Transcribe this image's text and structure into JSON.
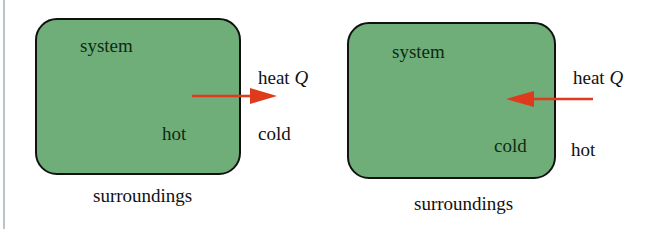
{
  "colors": {
    "system_fill": "#6fae78",
    "border": "#111111",
    "arrow": "#e03a1c",
    "rule": "#b9c3c8"
  },
  "panels": [
    {
      "system_label": "system",
      "system_temp": "hot",
      "heat_label": "heat",
      "heat_symbol": "Q",
      "surroundings_temp": "cold",
      "surroundings_label": "surroundings",
      "arrow_direction": "out-of-system"
    },
    {
      "system_label": "system",
      "system_temp": "cold",
      "heat_label": "heat",
      "heat_symbol": "Q",
      "surroundings_temp": "hot",
      "surroundings_label": "surroundings",
      "arrow_direction": "into-system"
    }
  ]
}
